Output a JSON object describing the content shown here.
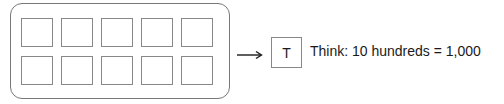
{
  "diagram": {
    "ten_frame": {
      "rows": 2,
      "columns": 5,
      "cells": [
        {
          "row": 1,
          "col": 1,
          "value": ""
        },
        {
          "row": 1,
          "col": 2,
          "value": ""
        },
        {
          "row": 1,
          "col": 3,
          "value": ""
        },
        {
          "row": 1,
          "col": 4,
          "value": ""
        },
        {
          "row": 1,
          "col": 5,
          "value": ""
        },
        {
          "row": 2,
          "col": 1,
          "value": ""
        },
        {
          "row": 2,
          "col": 2,
          "value": ""
        },
        {
          "row": 2,
          "col": 3,
          "value": ""
        },
        {
          "row": 2,
          "col": 4,
          "value": ""
        },
        {
          "row": 2,
          "col": 5,
          "value": ""
        }
      ]
    },
    "arrow_icon": "right-arrow",
    "result_box_label": "T",
    "think_text": "Think: 10 hundreds = 1,000"
  }
}
